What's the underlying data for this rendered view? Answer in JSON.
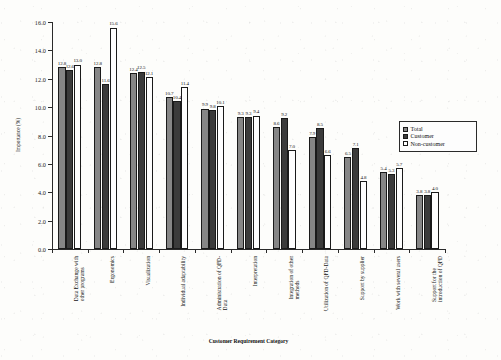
{
  "chart_data": {
    "type": "bar",
    "title": "",
    "xlabel": "Customer Requirement Category",
    "ylabel": "Importance (%)",
    "ylim": [
      0.0,
      16.0
    ],
    "ytick_step": 2.0,
    "yticks": [
      "0.0",
      "2.0",
      "4.0",
      "6.0",
      "8.0",
      "10.0",
      "12.0",
      "14.0",
      "16.0"
    ],
    "grid": false,
    "legend_position": "right",
    "categories": [
      "Data Exchange with other programs",
      "Ergonomics",
      "Visualization",
      "Individual adaptability",
      "Administration of QFD-Data",
      "Interpretation",
      "Integration of other methods",
      "Utilization of QFD-Data",
      "Support by supplier",
      "Work with several users",
      "Support for the introduction of QFD"
    ],
    "category_lines": [
      [
        "Data Exchange with",
        "other programs"
      ],
      [
        "Ergonomics",
        ""
      ],
      [
        "Visualization",
        ""
      ],
      [
        "Individual adaptability",
        ""
      ],
      [
        "Administration of QFD-",
        "Data"
      ],
      [
        "Interpretation",
        ""
      ],
      [
        "Integration of other",
        "methods"
      ],
      [
        "Utilization of QFD-Data",
        ""
      ],
      [
        "Support by supplier",
        ""
      ],
      [
        "Work with several users",
        ""
      ],
      [
        "Support for the",
        "introduction of QFD"
      ]
    ],
    "series": [
      {
        "name": "Total",
        "color": "#868686",
        "values": [
          12.8,
          12.8,
          12.4,
          10.7,
          9.9,
          9.3,
          8.6,
          7.9,
          6.5,
          5.4,
          3.8
        ]
      },
      {
        "name": "Customer",
        "color": "#3b3b3b",
        "values": [
          12.6,
          11.6,
          12.5,
          10.4,
          9.8,
          9.3,
          9.2,
          8.5,
          7.1,
          5.3,
          3.8
        ]
      },
      {
        "name": "Non-customer",
        "color": "#fefefe",
        "values": [
          13.0,
          15.6,
          12.1,
          11.4,
          10.1,
          9.4,
          7.0,
          6.6,
          4.8,
          5.7,
          4.0
        ]
      }
    ]
  },
  "legend": {
    "items": [
      {
        "label": "Total",
        "key": "total"
      },
      {
        "label": "Customer",
        "key": "customer"
      },
      {
        "label": "Non-customer",
        "key": "noncustomer"
      }
    ]
  }
}
